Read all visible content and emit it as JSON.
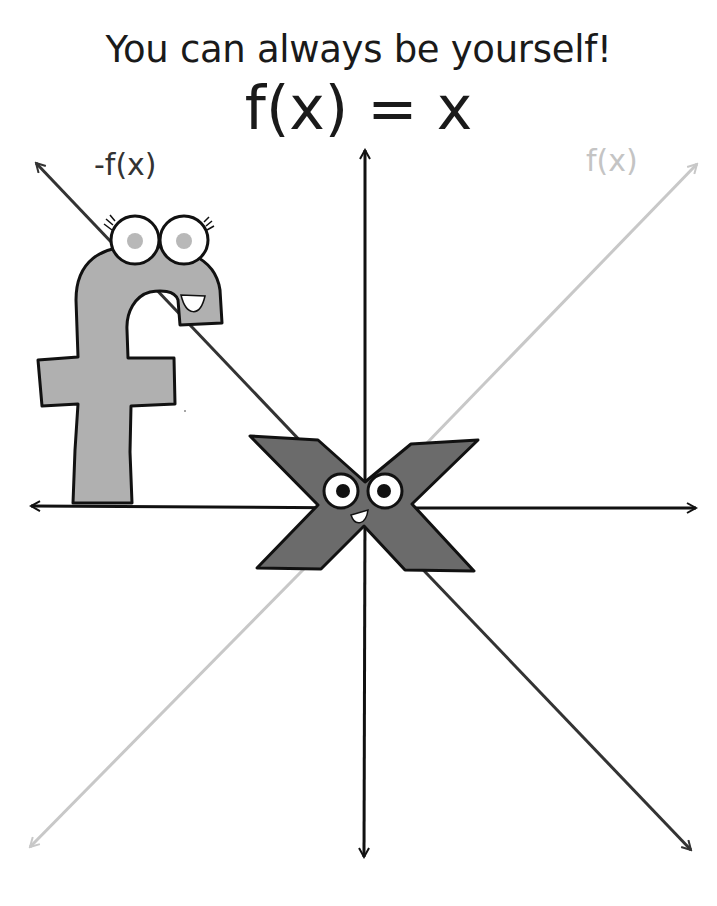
{
  "title": "You can always be yourself!",
  "equation": "f(x) = x",
  "labels": {
    "negative_function": "-f(x)",
    "function": "f(x)"
  },
  "characters": {
    "f": {
      "letter": "f",
      "color": "#b0b0b0"
    },
    "x": {
      "letter": "x",
      "color": "#6b6b6b"
    }
  },
  "colors": {
    "axis": "#111111",
    "neg_line": "#333333",
    "pos_line": "#c8c8c8",
    "background": "#ffffff"
  }
}
